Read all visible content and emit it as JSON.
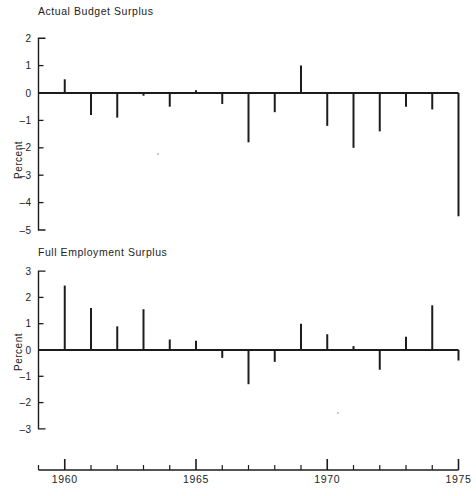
{
  "figure": {
    "width": 476,
    "height": 496,
    "background": "#ffffff",
    "ink_color": "#1c1c1c"
  },
  "chart_data": [
    {
      "id": "actual-budget-surplus",
      "type": "bar",
      "title": "Actual Budget Surplus",
      "xlabel": "",
      "ylabel": "Percent",
      "ylim": [
        -5,
        2
      ],
      "yticks": [
        2,
        1,
        0,
        -1,
        -2,
        -3,
        -4,
        -5
      ],
      "ytick_labels": [
        "2",
        "1",
        "0",
        "-1",
        "-2",
        "-3",
        "-4",
        "-5"
      ],
      "xlim": [
        1959,
        1975.4
      ],
      "grid": false,
      "legend": "none",
      "categories": [
        1960,
        1961,
        1962,
        1963,
        1964,
        1965,
        1966,
        1967,
        1968,
        1969,
        1970,
        1971,
        1972,
        1973,
        1974,
        1975
      ],
      "values": [
        0.5,
        -0.8,
        -0.9,
        -0.1,
        -0.5,
        0.1,
        -0.4,
        -1.8,
        -0.7,
        1.0,
        -1.2,
        -2.0,
        -1.4,
        -0.5,
        -0.6,
        -4.5
      ]
    },
    {
      "id": "full-employment-surplus",
      "type": "bar",
      "title": "Full Employment Surplus",
      "xlabel": "",
      "ylabel": "Percent",
      "ylim": [
        -3,
        3
      ],
      "yticks": [
        3,
        2,
        1,
        0,
        -1,
        -2,
        -3
      ],
      "ytick_labels": [
        "3",
        "2",
        "1",
        "0",
        "-1",
        "-2",
        "-3"
      ],
      "xlim": [
        1959,
        1975.4
      ],
      "grid": false,
      "legend": "none",
      "categories": [
        1960,
        1961,
        1962,
        1963,
        1964,
        1965,
        1966,
        1967,
        1968,
        1969,
        1970,
        1971,
        1972,
        1973,
        1974,
        1975
      ],
      "values": [
        2.45,
        1.6,
        0.9,
        1.55,
        0.4,
        0.35,
        -0.3,
        -1.3,
        -0.45,
        1.0,
        0.6,
        0.15,
        -0.75,
        0.5,
        1.7,
        -0.4
      ]
    }
  ],
  "x_axis": {
    "name": "year-axis",
    "start_year": 1959,
    "end_year": 1975,
    "minor_ticks": [
      1959,
      1960,
      1961,
      1962,
      1963,
      1964,
      1965,
      1966,
      1967,
      1968,
      1969,
      1970,
      1971,
      1972,
      1973,
      1974,
      1975
    ],
    "major_ticks": [
      1960,
      1965,
      1970,
      1975
    ],
    "labels": [
      "1960",
      "1965",
      "1970",
      "1975"
    ]
  }
}
